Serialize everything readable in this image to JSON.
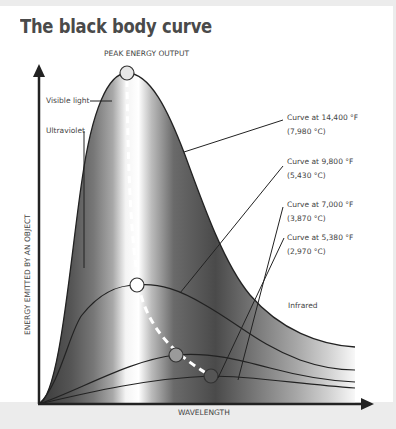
{
  "title": "The black body curve",
  "labels": {
    "peak": "PEAK ENERGY OUTPUT",
    "visible": "Visible light",
    "ultraviolet": "Ultraviolet",
    "infrared": "Infrared",
    "y_axis": "ENERGY EMITTED BY AN OBJECT",
    "x_axis": "WAVELENGTH"
  },
  "curves": [
    {
      "line1": "Curve at 14,400 °F",
      "line2": "(7,980 °C)"
    },
    {
      "line1": "Curve at 9,800 °F",
      "line2": "(5,430 °C)"
    },
    {
      "line1": "Curve at 7,000 °F",
      "line2": "(3,870 °C)"
    },
    {
      "line1": "Curve at 5,380 °F",
      "line2": "(2,970 °C)"
    }
  ],
  "colors": {
    "background": "#ececec",
    "card": "#ffffff",
    "text": "#444444",
    "curve": "#222222",
    "peak_marker_14400": "#e6e6e6",
    "peak_marker_9800": "#ffffff",
    "peak_marker_7000": "#9a9a9a",
    "peak_marker_5380": "#555555"
  }
}
